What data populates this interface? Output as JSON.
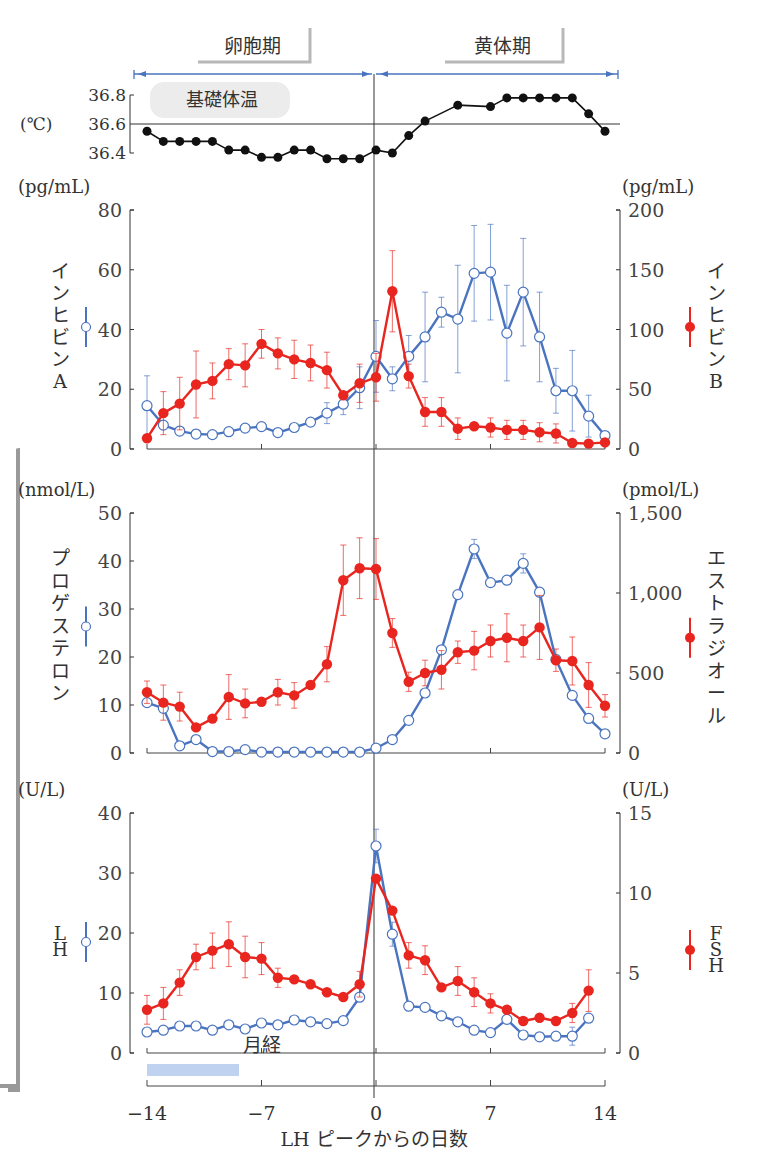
{
  "chart_data": [
    {
      "type": "line",
      "title": "基礎体温",
      "ylabel": "(℃)",
      "yticks": [
        36.4,
        36.6,
        36.8
      ],
      "ylim": [
        36.4,
        36.8
      ],
      "reference_line": 36.6,
      "x": [
        -14,
        -13,
        -12,
        -11,
        -10,
        -9,
        -8,
        -7,
        -6,
        -5,
        -4,
        -3,
        -2,
        -1,
        0,
        1,
        2,
        3,
        4,
        5,
        6,
        7,
        8,
        9,
        10,
        11,
        12,
        13,
        14
      ],
      "series": [
        {
          "name": "基礎体温",
          "color": "#111111",
          "values": [
            36.55,
            36.48,
            36.48,
            36.48,
            36.48,
            36.42,
            36.42,
            36.37,
            36.37,
            36.42,
            36.42,
            36.36,
            36.36,
            36.36,
            36.42,
            36.4,
            36.52,
            36.62,
            null,
            36.73,
            null,
            36.72,
            36.78,
            36.78,
            36.78,
            36.78,
            36.78,
            36.67,
            36.55
          ]
        }
      ]
    },
    {
      "type": "line",
      "left_axis": {
        "unit": "(pg/mL)",
        "label": "インヒビンA",
        "ticks": [
          0,
          20,
          40,
          60,
          80
        ],
        "ylim": [
          0,
          80
        ]
      },
      "right_axis": {
        "unit": "(pg/mL)",
        "label": "インヒビンB",
        "ticks": [
          0,
          50,
          100,
          150,
          200
        ],
        "ylim": [
          0,
          200
        ]
      },
      "x": [
        -14,
        -13,
        -12,
        -11,
        -10,
        -9,
        -8,
        -7,
        -6,
        -5,
        -4,
        -3,
        -2,
        -1,
        0,
        1,
        2,
        3,
        4,
        5,
        6,
        7,
        8,
        9,
        10,
        11,
        12,
        13,
        14
      ],
      "series": [
        {
          "name": "インヒビンA",
          "axis": "left",
          "color": "#4a74c0",
          "marker": "open-circle",
          "values": [
            14.5,
            8,
            6,
            5,
            4.8,
            5.8,
            7,
            7.5,
            5.5,
            7.2,
            9,
            12,
            15,
            20.5,
            31,
            23.5,
            31,
            37.5,
            45.8,
            43.5,
            58.8,
            59.2,
            38.8,
            52.5,
            37.5,
            19.5,
            19.5,
            11,
            4.5
          ],
          "errors": [
            10,
            0,
            0,
            0,
            0,
            0,
            0,
            0,
            0,
            0,
            0,
            3.5,
            3.5,
            7,
            12,
            4,
            7,
            15,
            5,
            18,
            16,
            16,
            16,
            18,
            15,
            7.5,
            13.5,
            7,
            0
          ]
        },
        {
          "name": "インヒビンB",
          "axis": "right",
          "color": "#e8261f",
          "marker": "filled-circle",
          "values": [
            9,
            30,
            38,
            54,
            57,
            71,
            70,
            88,
            80,
            75,
            72,
            66,
            45,
            55,
            60,
            132,
            61,
            31,
            31,
            17,
            19,
            18,
            16,
            16,
            14,
            13,
            5,
            4.5,
            5.5
          ],
          "errors": [
            0,
            18,
            22,
            28,
            15,
            13,
            18,
            12,
            13,
            16,
            15,
            15,
            0,
            16,
            20,
            34,
            10,
            12,
            12,
            9,
            0,
            8,
            8,
            8,
            8,
            8,
            0,
            0,
            0
          ]
        }
      ]
    },
    {
      "type": "line",
      "left_axis": {
        "unit": "(nmol/L)",
        "label": "プロゲステロン",
        "ticks": [
          0,
          10,
          20,
          30,
          40,
          50
        ],
        "ylim": [
          0,
          50
        ]
      },
      "right_axis": {
        "unit": "(pmol/L)",
        "label": "エストラジオール",
        "ticks": [
          "0",
          "500",
          "1,000",
          "1,500"
        ],
        "ylim": [
          0,
          1500
        ]
      },
      "x": [
        -14,
        -13,
        -12,
        -11,
        -10,
        -9,
        -8,
        -7,
        -6,
        -5,
        -4,
        -3,
        -2,
        -1,
        0,
        1,
        2,
        3,
        4,
        5,
        6,
        7,
        8,
        9,
        10,
        11,
        12,
        13,
        14
      ],
      "series": [
        {
          "name": "プロゲステロン",
          "axis": "left",
          "color": "#4a74c0",
          "marker": "open-circle",
          "values": [
            10.5,
            9.3,
            1.5,
            2.8,
            0.3,
            0.3,
            0.7,
            0.2,
            0.2,
            0.2,
            0.2,
            0.2,
            0.2,
            0.2,
            1.0,
            2.8,
            6.8,
            12.5,
            21.5,
            33,
            42.5,
            35.5,
            36,
            39.5,
            33.5,
            19.5,
            12,
            7.2,
            4
          ],
          "errors": [
            0,
            0,
            0,
            0,
            0,
            0,
            0,
            0,
            0,
            0,
            0,
            0,
            0,
            0,
            0,
            0,
            0,
            0,
            0,
            0,
            2,
            0,
            0,
            2,
            0,
            0,
            0,
            0,
            0
          ]
        },
        {
          "name": "エストラジオール",
          "axis": "right",
          "color": "#e8261f",
          "marker": "filled-circle",
          "values": [
            380,
            315,
            290,
            160,
            215,
            350,
            310,
            320,
            380,
            360,
            425,
            555,
            1080,
            1155,
            1150,
            750,
            445,
            500,
            520,
            630,
            640,
            700,
            720,
            700,
            785,
            580,
            575,
            425,
            295
          ],
          "errors": [
            70,
            110,
            90,
            0,
            0,
            140,
            90,
            0,
            80,
            80,
            0,
            110,
            220,
            190,
            190,
            90,
            60,
            80,
            120,
            70,
            120,
            100,
            150,
            100,
            200,
            70,
            150,
            140,
            70
          ]
        }
      ]
    },
    {
      "type": "line",
      "left_axis": {
        "unit": "(U/L)",
        "label": "LH",
        "ticks": [
          0,
          10,
          20,
          30,
          40
        ],
        "ylim": [
          0,
          40
        ]
      },
      "right_axis": {
        "unit": "(U/L)",
        "label": "FSH",
        "ticks": [
          0,
          5,
          10,
          15
        ],
        "ylim": [
          0,
          15
        ]
      },
      "x": [
        -14,
        -13,
        -12,
        -11,
        -10,
        -9,
        -8,
        -7,
        -6,
        -5,
        -4,
        -3,
        -2,
        -1,
        0,
        1,
        2,
        3,
        4,
        5,
        6,
        7,
        8,
        9,
        10,
        11,
        12,
        13,
        14
      ],
      "xlabel": "LH ピークからの日数",
      "xticks": [
        "-14",
        "-7",
        "0",
        "7",
        "14"
      ],
      "annotation": "月経 (day -14 to -10)",
      "series": [
        {
          "name": "LH",
          "axis": "left",
          "color": "#4a74c0",
          "marker": "open-circle",
          "values": [
            3.5,
            3.8,
            4.5,
            4.5,
            3.8,
            4.7,
            4.0,
            5.0,
            4.7,
            5.5,
            5.2,
            4.9,
            5.4,
            9.3,
            34.5,
            19.8,
            7.8,
            7.6,
            6.2,
            5.2,
            3.8,
            3.4,
            5.6,
            3.0,
            2.7,
            2.8,
            2.8,
            5.8,
            null
          ],
          "errors": [
            0,
            0,
            0,
            0,
            0,
            0,
            0,
            0,
            0,
            0,
            0,
            0,
            0,
            0,
            2.8,
            2,
            0,
            0,
            0,
            0,
            0,
            0,
            0,
            0,
            0,
            0,
            1.5,
            0,
            0
          ]
        },
        {
          "name": "FSH",
          "axis": "right",
          "color": "#e8261f",
          "marker": "filled-circle",
          "values": [
            2.7,
            3.1,
            4.4,
            6.0,
            6.4,
            6.8,
            6.0,
            5.9,
            4.7,
            4.6,
            4.3,
            3.8,
            3.5,
            4.3,
            10.9,
            8.9,
            6.1,
            5.8,
            4.1,
            4.5,
            3.8,
            3.1,
            2.7,
            2.0,
            2.2,
            2.0,
            2.5,
            3.9,
            null
          ],
          "errors": [
            0.9,
            1.0,
            0.8,
            0.8,
            1.1,
            1.4,
            1.3,
            1.0,
            0.6,
            0,
            0,
            0,
            0,
            0.8,
            0,
            0,
            0.8,
            0.9,
            0,
            0.9,
            0.9,
            0.6,
            0,
            0,
            0,
            0,
            0.6,
            1.3,
            0
          ]
        }
      ]
    }
  ],
  "phases": {
    "follicular": "卵胞期",
    "luteal": "黄体期"
  },
  "bbt": {
    "title": "基礎体温",
    "unit": "(℃)",
    "ticks": [
      "36.8",
      "36.6",
      "36.4"
    ]
  },
  "panel1": {
    "left_unit": "(pg/mL)",
    "right_unit": "(pg/mL)",
    "left_ticks": [
      "80",
      "60",
      "40",
      "20",
      "0"
    ],
    "right_ticks": [
      "200",
      "150",
      "100",
      "50",
      "0"
    ],
    "left_label": [
      "イ",
      "ン",
      "ヒ",
      "ビ",
      "ン",
      "A"
    ],
    "right_label": [
      "イ",
      "ン",
      "ヒ",
      "ビ",
      "ン",
      "B"
    ]
  },
  "panel2": {
    "left_unit": "(nmol/L)",
    "right_unit": "(pmol/L)",
    "left_ticks": [
      "50",
      "40",
      "30",
      "20",
      "10",
      "0"
    ],
    "right_ticks": [
      "1,500",
      "1,000",
      "500",
      "0"
    ],
    "left_label": [
      "プ",
      "ロ",
      "ゲ",
      "ス",
      "テ",
      "ロ",
      "ン"
    ],
    "right_label": [
      "エ",
      "ス",
      "ト",
      "ラ",
      "ジ",
      "オ",
      "ー",
      "ル"
    ]
  },
  "panel3": {
    "left_unit": "(U/L)",
    "right_unit": "(U/L)",
    "left_ticks": [
      "40",
      "30",
      "20",
      "10",
      "0"
    ],
    "right_ticks": [
      "15",
      "10",
      "5",
      "0"
    ],
    "left_label": [
      "L",
      "H"
    ],
    "right_label": [
      "F",
      "S",
      "H"
    ]
  },
  "xaxis": {
    "ticks": [
      "−14",
      "−7",
      "0",
      "7",
      "14"
    ],
    "label": "LH ピークからの日数"
  },
  "menses": "月経",
  "colors": {
    "blue": "#4a74c0",
    "red": "#e8261f",
    "black": "#111111",
    "axis": "#444444"
  }
}
